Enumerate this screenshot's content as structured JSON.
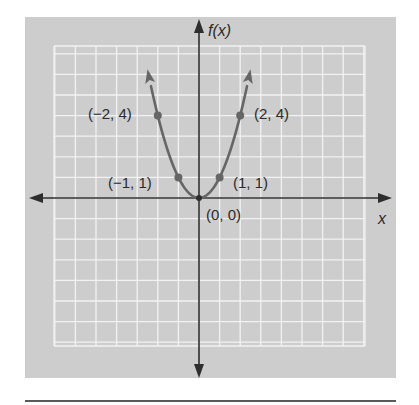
{
  "chart_data": {
    "type": "line",
    "title": "",
    "function": "f(x) = x^2",
    "xlabel": "x",
    "ylabel": "f(x)",
    "grid": true,
    "xlim": [
      -7,
      8
    ],
    "ylim": [
      -7.3,
      7.4
    ],
    "series": [
      {
        "name": "f(x) = x^2",
        "x": [
          -2.5,
          -2,
          -1,
          0,
          1,
          2,
          2.5
        ],
        "y": [
          6.25,
          4,
          1,
          0,
          1,
          4,
          6.25
        ],
        "arrows_at_ends": true
      }
    ],
    "points": [
      {
        "x": -2,
        "y": 4,
        "label": "(−2, 4)"
      },
      {
        "x": -1,
        "y": 1,
        "label": "(−1, 1)"
      },
      {
        "x": 0,
        "y": 0,
        "label": "(0, 0)"
      },
      {
        "x": 1,
        "y": 1,
        "label": "(1, 1)"
      },
      {
        "x": 2,
        "y": 4,
        "label": "(2, 4)"
      }
    ]
  },
  "labels": {
    "x_axis": "x",
    "y_axis": "f(x)",
    "p_m2_4": "(−2, 4)",
    "p_m1_1": "(−1, 1)",
    "p_0_0": "(0, 0)",
    "p_1_1": "(1, 1)",
    "p_2_4": "(2, 4)"
  },
  "colors": {
    "panel": "#cdcdcd",
    "grid": "#f2f2f2",
    "axes": "#2e2e2e",
    "curve": "#666666",
    "rule": "#5a5a5a"
  }
}
